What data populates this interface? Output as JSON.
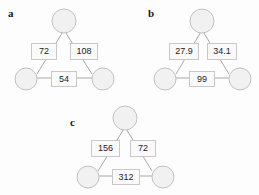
{
  "figure": {
    "background_color": "#fdfdfd",
    "node_fill_color": "#f1f1f1",
    "node_stroke_color": "#c2c2c2",
    "edge_color": "#a8a8a8",
    "label_box_border_color": "#c8c8c8",
    "label_text_color": "#222222"
  },
  "panels": [
    {
      "letter": "a",
      "nodes": [
        {
          "id": "top",
          "label": ""
        },
        {
          "id": "bottom-left",
          "label": ""
        },
        {
          "id": "bottom-right",
          "label": ""
        }
      ],
      "edges": [
        {
          "id": "top-to-bottom-left",
          "label": "72"
        },
        {
          "id": "top-to-bottom-right",
          "label": "108"
        },
        {
          "id": "bottom-left-to-bottom-right",
          "label": "54"
        }
      ]
    },
    {
      "letter": "b",
      "nodes": [
        {
          "id": "top",
          "label": ""
        },
        {
          "id": "bottom-left",
          "label": ""
        },
        {
          "id": "bottom-right",
          "label": ""
        }
      ],
      "edges": [
        {
          "id": "top-to-bottom-left",
          "label": "27.9"
        },
        {
          "id": "top-to-bottom-right",
          "label": "34.1"
        },
        {
          "id": "bottom-left-to-bottom-right",
          "label": "99"
        }
      ]
    },
    {
      "letter": "c",
      "nodes": [
        {
          "id": "top",
          "label": ""
        },
        {
          "id": "bottom-left",
          "label": ""
        },
        {
          "id": "bottom-right",
          "label": ""
        }
      ],
      "edges": [
        {
          "id": "top-to-bottom-left",
          "label": "156"
        },
        {
          "id": "top-to-bottom-right",
          "label": "72"
        },
        {
          "id": "bottom-left-to-bottom-right",
          "label": "312"
        }
      ]
    }
  ]
}
